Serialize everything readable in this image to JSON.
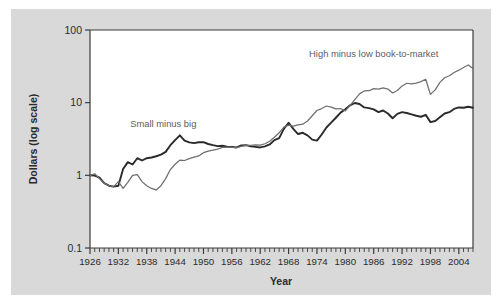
{
  "chart_data": {
    "type": "line",
    "title": "",
    "xlabel": "Year",
    "ylabel": "Dollars (log scale)",
    "log_y": true,
    "ylim": [
      0.1,
      100
    ],
    "xlim": [
      1926,
      2007
    ],
    "y_ticks": [
      "0.1",
      "1",
      "10",
      "100"
    ],
    "y_tick_values": [
      0.1,
      1,
      10,
      100
    ],
    "x_ticks": [
      "1926",
      "1932",
      "1938",
      "1944",
      "1950",
      "1956",
      "1962",
      "1968",
      "1974",
      "1980",
      "1986",
      "1992",
      "1998",
      "2004"
    ],
    "x_tick_values": [
      1926,
      1932,
      1938,
      1944,
      1950,
      1956,
      1962,
      1968,
      1974,
      1980,
      1986,
      1992,
      1998,
      2004
    ],
    "x_minor_step": 1,
    "grid": false,
    "legend_position": "inline-annotation",
    "colors": {
      "small_minus_big": "#2a2a2a",
      "high_minus_low": "#6e6e6e",
      "axis": "#3b3b3b",
      "panel_background": "#d9d9d9",
      "plot_background": "#ffffff"
    },
    "annotations": [
      {
        "name": "small-minus-big-label",
        "text": "Small minus big",
        "x": 1941.5,
        "y": 4.6
      },
      {
        "name": "high-minus-low-label",
        "text": "High minus low book-to-market",
        "x": 1986.0,
        "y": 42.0
      }
    ],
    "x": [
      1926,
      1927,
      1928,
      1929,
      1930,
      1931,
      1932,
      1933,
      1934,
      1935,
      1936,
      1937,
      1938,
      1939,
      1940,
      1941,
      1942,
      1943,
      1944,
      1945,
      1946,
      1947,
      1948,
      1949,
      1950,
      1951,
      1952,
      1953,
      1954,
      1955,
      1956,
      1957,
      1958,
      1959,
      1960,
      1961,
      1962,
      1963,
      1964,
      1965,
      1966,
      1967,
      1968,
      1969,
      1970,
      1971,
      1972,
      1973,
      1974,
      1975,
      1976,
      1977,
      1978,
      1979,
      1980,
      1981,
      1982,
      1983,
      1984,
      1985,
      1986,
      1987,
      1988,
      1989,
      1990,
      1991,
      1992,
      1993,
      1994,
      1995,
      1996,
      1997,
      1998,
      1999,
      2000,
      2001,
      2002,
      2003,
      2004,
      2005,
      2006,
      2007
    ],
    "series": [
      {
        "name": "Small minus big",
        "color": "#2a2a2a",
        "values": [
          1.0,
          0.99,
          0.93,
          0.78,
          0.72,
          0.7,
          0.72,
          1.22,
          1.52,
          1.41,
          1.72,
          1.6,
          1.72,
          1.76,
          1.83,
          1.93,
          2.1,
          2.6,
          3.05,
          3.55,
          3.0,
          2.84,
          2.77,
          2.85,
          2.86,
          2.7,
          2.6,
          2.52,
          2.55,
          2.48,
          2.46,
          2.42,
          2.58,
          2.6,
          2.5,
          2.46,
          2.42,
          2.5,
          2.66,
          3.05,
          3.25,
          4.35,
          5.3,
          4.35,
          3.7,
          3.85,
          3.55,
          3.1,
          3.0,
          3.65,
          4.55,
          5.3,
          6.2,
          7.3,
          8.1,
          9.2,
          9.9,
          9.6,
          8.6,
          8.4,
          8.1,
          7.4,
          7.8,
          7.1,
          6.1,
          7.0,
          7.4,
          7.2,
          6.9,
          6.6,
          6.4,
          6.8,
          5.4,
          5.6,
          6.3,
          7.1,
          7.4,
          8.2,
          8.6,
          8.5,
          8.8,
          8.5
        ]
      },
      {
        "name": "High minus low book-to-market",
        "color": "#6e6e6e",
        "values": [
          1.0,
          1.05,
          0.9,
          0.78,
          0.72,
          0.7,
          0.82,
          0.66,
          0.8,
          1.0,
          1.02,
          0.82,
          0.72,
          0.66,
          0.63,
          0.72,
          0.9,
          1.2,
          1.42,
          1.62,
          1.6,
          1.7,
          1.78,
          1.85,
          2.05,
          2.15,
          2.22,
          2.3,
          2.42,
          2.45,
          2.42,
          2.4,
          2.5,
          2.58,
          2.58,
          2.62,
          2.6,
          2.72,
          2.95,
          3.35,
          3.85,
          4.6,
          4.9,
          4.75,
          4.95,
          5.05,
          5.6,
          6.6,
          7.8,
          8.3,
          9.0,
          8.7,
          8.2,
          8.3,
          7.7,
          9.2,
          11.0,
          13.2,
          14.5,
          14.6,
          15.6,
          15.4,
          16.0,
          15.4,
          13.6,
          14.7,
          17.0,
          18.5,
          18.1,
          18.6,
          19.5,
          21.0,
          13.0,
          15.0,
          19.0,
          22.0,
          23.5,
          26.0,
          28.0,
          30.5,
          33.0,
          29.5
        ]
      }
    ]
  },
  "footer": {
    "axis_title_year": "Year"
  }
}
